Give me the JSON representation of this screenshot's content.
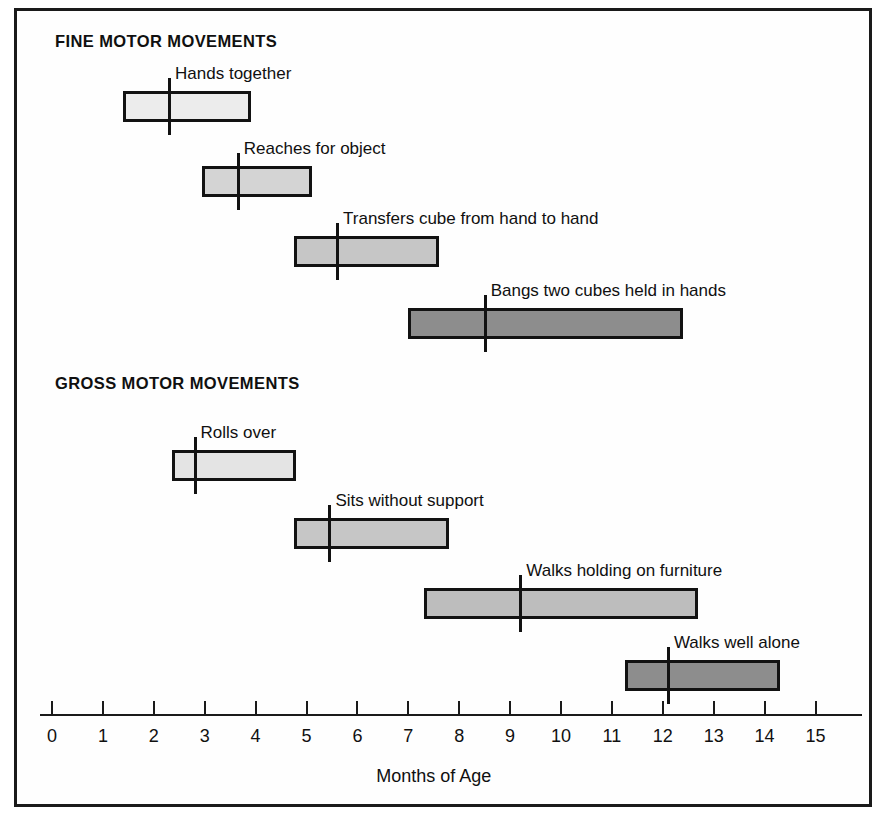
{
  "figure": {
    "background_color": "#ffffff",
    "frame_color": "#1a1a1a",
    "outer_color": "#8c8c8c"
  },
  "sections": [
    {
      "id": "fine",
      "title": "FINE MOTOR MOVEMENTS"
    },
    {
      "id": "gross",
      "title": "GROSS MOTOR MOVEMENTS"
    }
  ],
  "axis": {
    "title": "Months of Age",
    "min": 0,
    "max": 15,
    "tick_step": 1,
    "tick_labels": [
      "0",
      "1",
      "2",
      "3",
      "4",
      "5",
      "6",
      "7",
      "8",
      "9",
      "10",
      "11",
      "12",
      "13",
      "14",
      "15"
    ],
    "px_origin": 52,
    "px_per_unit": 50.9
  },
  "chart_data": {
    "type": "bar",
    "subtype": "horizontal-range-with-median",
    "title": "",
    "subtitle": "",
    "xlabel": "Months of Age",
    "ylabel": "",
    "xlim": [
      0,
      15
    ],
    "grid": false,
    "legend": null,
    "groups": [
      {
        "name": "FINE MOTOR MOVEMENTS",
        "milestones": [
          {
            "label": "Hands together",
            "start": 1.4,
            "median": 2.3,
            "end": 3.9,
            "fill": "#ececec"
          },
          {
            "label": "Reaches for object",
            "start": 2.95,
            "median": 3.65,
            "end": 5.1,
            "fill": "#d4d4d4"
          },
          {
            "label": "Transfers cube from hand to hand",
            "start": 4.75,
            "median": 5.6,
            "end": 7.6,
            "fill": "#c6c6c6"
          },
          {
            "label": "Bangs two cubes held in hands",
            "start": 7.0,
            "median": 8.5,
            "end": 12.4,
            "fill": "#8d8d8d"
          }
        ]
      },
      {
        "name": "GROSS MOTOR MOVEMENTS",
        "milestones": [
          {
            "label": "Rolls over",
            "start": 2.35,
            "median": 2.8,
            "end": 4.8,
            "fill": "#e4e4e4"
          },
          {
            "label": "Sits without support",
            "start": 4.75,
            "median": 5.45,
            "end": 7.8,
            "fill": "#c6c6c6"
          },
          {
            "label": "Walks holding on furniture",
            "start": 7.3,
            "median": 9.2,
            "end": 12.7,
            "fill": "#bdbdbd"
          },
          {
            "label": "Walks well alone",
            "start": 11.25,
            "median": 12.1,
            "end": 14.3,
            "fill": "#8d8d8d"
          }
        ]
      }
    ]
  },
  "layout": {
    "section_title_y": [
      32,
      374
    ],
    "bar_tops": [
      91,
      166,
      236,
      308,
      450,
      518,
      588,
      660
    ],
    "bar_height": 31,
    "median_overhang": 13,
    "axis_y": 714,
    "axis_x_start": 40,
    "axis_x_end": 862,
    "tick_height": 13,
    "tick_label_y": 726,
    "axis_title_y": 766
  }
}
